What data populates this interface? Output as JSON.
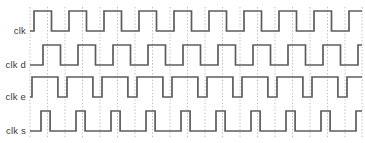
{
  "diagram": {
    "width": 365,
    "height": 143,
    "background_color": "#ffffff",
    "waveform_color": "#5d5d5d",
    "gridline_color": "#b9b9b9",
    "label_color": "#3a3a3a"
  },
  "chart_data": {
    "type": "line",
    "subtype": "digital-timing-waveform",
    "title": "",
    "xlabel": "",
    "ylabel": "",
    "grid": true,
    "legend_position": "left-labels",
    "plot_area": {
      "x0": 30,
      "x1": 362,
      "y_top": 8,
      "y_bottom": 136
    },
    "time_axis": {
      "period_px": 35,
      "first_edge_px": 30,
      "cycles_visible": 9,
      "gridline_positions_px": [
        30,
        47.5,
        65,
        82.5,
        100,
        117.5,
        135,
        152.5,
        170,
        187.5,
        205,
        222.5,
        240,
        257.5,
        275,
        292.5,
        310,
        327.5,
        345,
        362
      ]
    },
    "signals": [
      {
        "name": "clk",
        "label": "clk",
        "row_index": 0,
        "baseline_y": 31,
        "high_y": 11,
        "duty_cycle_pct": 50,
        "phase_offset_px": 4,
        "initial_state": "low",
        "pulse_count": 9,
        "description": "reference clock, 50 percent duty square wave"
      },
      {
        "name": "clk d",
        "label": "clk d",
        "row_index": 1,
        "baseline_y": 65,
        "high_y": 45,
        "duty_cycle_pct": 50,
        "phase_offset_px": 13,
        "initial_state": "low",
        "pulse_count": 9,
        "description": "delayed clock, shifted right relative to clk"
      },
      {
        "name": "clk e",
        "label": "clk e",
        "row_index": 2,
        "baseline_y": 97,
        "high_y": 77,
        "duty_cycle_pct": 74,
        "phase_offset_px": 2,
        "initial_state": "low",
        "pulse_count": 9,
        "description": "extended clock, wide high and narrow low phases"
      },
      {
        "name": "clk s",
        "label": "clk s",
        "row_index": 3,
        "baseline_y": 131,
        "high_y": 111,
        "duty_cycle_pct": 26,
        "phase_offset_px": 11,
        "initial_state": "low",
        "pulse_count": 9,
        "description": "short clock, narrow high pulses"
      }
    ]
  }
}
